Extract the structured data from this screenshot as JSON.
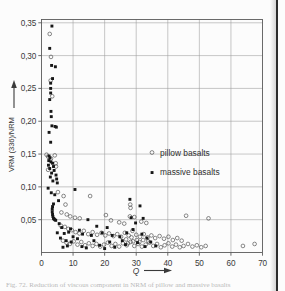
{
  "figure": {
    "background_color": "#fcfcfc",
    "caption_partial": "Fig. 72.  Reduction of viscous component in NRM of pillow and massive basalts"
  },
  "chart_data": {
    "type": "scatter",
    "title": "",
    "xlabel": "Q",
    "ylabel": "VRM (336)/NRM",
    "xlim": [
      0,
      70
    ],
    "ylim": [
      0,
      0.355
    ],
    "xticks": [
      0,
      10,
      20,
      30,
      40,
      50,
      60,
      70
    ],
    "xtick_labels": [
      "0",
      "10",
      "20",
      "30",
      "40",
      "50",
      "60",
      "70"
    ],
    "yticks": [
      0.05,
      0.1,
      0.15,
      0.2,
      0.25,
      0.3,
      0.35
    ],
    "ytick_labels": [
      "0,05",
      "0,10",
      "0,15",
      "0,20",
      "0,25",
      "0,30",
      "0,35"
    ],
    "grid": true,
    "legend_position": "center-right",
    "series": [
      {
        "name": "pillow basalts",
        "marker": "open-circle",
        "color": "#4a4a4a",
        "points": [
          [
            2.6,
            0.333
          ],
          [
            2.9,
            0.262
          ],
          [
            3.0,
            0.298
          ],
          [
            3.4,
            0.238
          ],
          [
            1.6,
            0.149
          ],
          [
            2.1,
            0.146
          ],
          [
            3.0,
            0.143
          ],
          [
            4.2,
            0.148
          ],
          [
            4.5,
            0.136
          ],
          [
            4.6,
            0.131
          ],
          [
            2.1,
            0.126
          ],
          [
            5.2,
            0.092
          ],
          [
            7.0,
            0.086
          ],
          [
            15.4,
            0.086
          ],
          [
            28.1,
            0.073
          ],
          [
            28.2,
            0.068
          ],
          [
            28.0,
            0.055
          ],
          [
            29.4,
            0.054
          ],
          [
            7.6,
            0.073
          ],
          [
            6.3,
            0.061
          ],
          [
            8.0,
            0.058
          ],
          [
            9.1,
            0.055
          ],
          [
            10.6,
            0.053
          ],
          [
            12.1,
            0.052
          ],
          [
            20.4,
            0.057
          ],
          [
            22.0,
            0.049
          ],
          [
            24.6,
            0.046
          ],
          [
            26.2,
            0.044
          ],
          [
            31.6,
            0.047
          ],
          [
            33.2,
            0.045
          ],
          [
            45.8,
            0.056
          ],
          [
            52.9,
            0.052
          ],
          [
            6.1,
            0.041
          ],
          [
            7.4,
            0.039
          ],
          [
            8.5,
            0.036
          ],
          [
            9.6,
            0.034
          ],
          [
            10.8,
            0.031
          ],
          [
            12.0,
            0.029
          ],
          [
            13.4,
            0.033
          ],
          [
            14.8,
            0.028
          ],
          [
            16.2,
            0.031
          ],
          [
            17.6,
            0.027
          ],
          [
            19.0,
            0.03
          ],
          [
            20.2,
            0.026
          ],
          [
            21.4,
            0.029
          ],
          [
            22.8,
            0.025
          ],
          [
            24.0,
            0.028
          ],
          [
            25.2,
            0.024
          ],
          [
            26.4,
            0.03
          ],
          [
            27.6,
            0.026
          ],
          [
            28.8,
            0.033
          ],
          [
            30.0,
            0.027
          ],
          [
            31.2,
            0.024
          ],
          [
            32.4,
            0.028
          ],
          [
            33.6,
            0.023
          ],
          [
            34.8,
            0.026
          ],
          [
            36.0,
            0.022
          ],
          [
            37.4,
            0.025
          ],
          [
            38.8,
            0.021
          ],
          [
            40.2,
            0.024
          ],
          [
            41.6,
            0.019
          ],
          [
            43.0,
            0.022
          ],
          [
            44.4,
            0.018
          ],
          [
            6.8,
            0.018
          ],
          [
            7.9,
            0.015
          ],
          [
            9.0,
            0.013
          ],
          [
            10.2,
            0.017
          ],
          [
            11.4,
            0.012
          ],
          [
            12.6,
            0.016
          ],
          [
            13.8,
            0.011
          ],
          [
            15.0,
            0.014
          ],
          [
            16.2,
            0.01
          ],
          [
            17.4,
            0.013
          ],
          [
            18.6,
            0.009
          ],
          [
            19.8,
            0.012
          ],
          [
            21.0,
            0.015
          ],
          [
            22.2,
            0.01
          ],
          [
            23.4,
            0.013
          ],
          [
            24.6,
            0.009
          ],
          [
            25.8,
            0.014
          ],
          [
            27.0,
            0.011
          ],
          [
            28.2,
            0.016
          ],
          [
            29.4,
            0.01
          ],
          [
            30.6,
            0.013
          ],
          [
            31.8,
            0.009
          ],
          [
            33.0,
            0.012
          ],
          [
            34.2,
            0.015
          ],
          [
            35.4,
            0.01
          ],
          [
            36.6,
            0.013
          ],
          [
            37.8,
            0.008
          ],
          [
            39.0,
            0.011
          ],
          [
            40.2,
            0.014
          ],
          [
            41.4,
            0.009
          ],
          [
            42.6,
            0.012
          ],
          [
            43.8,
            0.008
          ],
          [
            45.0,
            0.01
          ],
          [
            46.4,
            0.013
          ],
          [
            47.8,
            0.009
          ],
          [
            49.2,
            0.011
          ],
          [
            50.6,
            0.008
          ],
          [
            52.0,
            0.01
          ],
          [
            63.8,
            0.01
          ],
          [
            67.5,
            0.013
          ],
          [
            26.8,
            0.02
          ],
          [
            28.5,
            0.023
          ],
          [
            30.2,
            0.019
          ],
          [
            29.0,
            0.017
          ],
          [
            31.0,
            0.016
          ],
          [
            32.2,
            0.019
          ],
          [
            27.4,
            0.014
          ],
          [
            33.8,
            0.017
          ]
        ]
      },
      {
        "name": "massive basalts",
        "marker": "filled-square",
        "color": "#171717",
        "points": [
          [
            3.3,
            0.345
          ],
          [
            2.6,
            0.311
          ],
          [
            3.2,
            0.285
          ],
          [
            4.4,
            0.283
          ],
          [
            3.5,
            0.265
          ],
          [
            2.9,
            0.258
          ],
          [
            2.9,
            0.25
          ],
          [
            2.9,
            0.243
          ],
          [
            2.6,
            0.233
          ],
          [
            3.0,
            0.215
          ],
          [
            3.1,
            0.207
          ],
          [
            3.3,
            0.193
          ],
          [
            4.3,
            0.192
          ],
          [
            4.7,
            0.191
          ],
          [
            2.4,
            0.183
          ],
          [
            2.9,
            0.168
          ],
          [
            2.4,
            0.147
          ],
          [
            2.7,
            0.144
          ],
          [
            2.3,
            0.14
          ],
          [
            3.0,
            0.138
          ],
          [
            3.5,
            0.136
          ],
          [
            2.2,
            0.133
          ],
          [
            3.8,
            0.131
          ],
          [
            2.6,
            0.128
          ],
          [
            4.0,
            0.125
          ],
          [
            3.2,
            0.121
          ],
          [
            4.6,
            0.118
          ],
          [
            2.8,
            0.115
          ],
          [
            4.8,
            0.112
          ],
          [
            3.6,
            0.109
          ],
          [
            5.0,
            0.106
          ],
          [
            2.1,
            0.098
          ],
          [
            10.6,
            0.096
          ],
          [
            3.1,
            0.091
          ],
          [
            4.2,
            0.088
          ],
          [
            28.0,
            0.081
          ],
          [
            31.2,
            0.071
          ],
          [
            5.4,
            0.079
          ],
          [
            3.8,
            0.074
          ],
          [
            3.5,
            0.07
          ],
          [
            3.4,
            0.066
          ],
          [
            3.4,
            0.062
          ],
          [
            3.5,
            0.058
          ],
          [
            3.6,
            0.055
          ],
          [
            3.8,
            0.052
          ],
          [
            4.0,
            0.051
          ],
          [
            4.2,
            0.05
          ],
          [
            4.5,
            0.049
          ],
          [
            14.7,
            0.05
          ],
          [
            28.4,
            0.053
          ],
          [
            32.2,
            0.052
          ],
          [
            29.8,
            0.045
          ],
          [
            5.6,
            0.044
          ],
          [
            6.4,
            0.038
          ],
          [
            17.5,
            0.04
          ],
          [
            20.8,
            0.038
          ],
          [
            9.2,
            0.036
          ],
          [
            12.0,
            0.034
          ],
          [
            5.0,
            0.03
          ],
          [
            7.2,
            0.029
          ],
          [
            8.6,
            0.031
          ],
          [
            13.0,
            0.028
          ],
          [
            15.8,
            0.026
          ],
          [
            19.2,
            0.03
          ],
          [
            22.4,
            0.026
          ],
          [
            24.8,
            0.024
          ],
          [
            27.0,
            0.03
          ],
          [
            29.0,
            0.035
          ],
          [
            31.8,
            0.028
          ],
          [
            33.4,
            0.022
          ],
          [
            10.0,
            0.024
          ],
          [
            11.4,
            0.021
          ],
          [
            6.0,
            0.022
          ],
          [
            7.8,
            0.018
          ],
          [
            9.4,
            0.016
          ],
          [
            16.6,
            0.018
          ],
          [
            21.6,
            0.016
          ],
          [
            25.6,
            0.018
          ],
          [
            30.4,
            0.015
          ],
          [
            34.6,
            0.016
          ],
          [
            8.2,
            0.01
          ],
          [
            12.8,
            0.009
          ],
          [
            18.4,
            0.011
          ],
          [
            23.2,
            0.008
          ],
          [
            26.6,
            0.012
          ],
          [
            32.8,
            0.009
          ],
          [
            36.2,
            0.01
          ],
          [
            6.8,
            0.008
          ],
          [
            14.2,
            0.007
          ],
          [
            20.0,
            0.006
          ]
        ]
      }
    ]
  },
  "legend": {
    "entries": [
      {
        "label": "pillow basalts",
        "marker": "open-circle"
      },
      {
        "label": "massive basalts",
        "marker": "filled-square"
      }
    ]
  },
  "axes": {
    "x_axis_title": "Q",
    "y_axis_title": "VRM (336)/NRM"
  }
}
